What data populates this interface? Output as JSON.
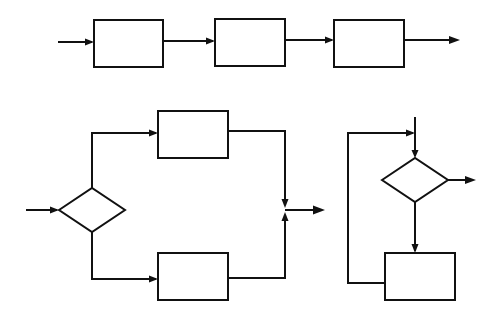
{
  "diagram": {
    "title": "",
    "groups": [
      {
        "id": "serial-chain",
        "description": "Three process blocks connected in series",
        "nodes": [
          {
            "id": "s1",
            "shape": "rect",
            "label": ""
          },
          {
            "id": "s2",
            "shape": "rect",
            "label": ""
          },
          {
            "id": "s3",
            "shape": "rect",
            "label": ""
          }
        ],
        "edges": [
          {
            "from": "input",
            "to": "s1"
          },
          {
            "from": "s1",
            "to": "s2"
          },
          {
            "from": "s2",
            "to": "s3"
          },
          {
            "from": "s3",
            "to": "output"
          }
        ]
      },
      {
        "id": "branch",
        "description": "Decision splits into two parallel process blocks that merge into one output",
        "nodes": [
          {
            "id": "d1",
            "shape": "diamond",
            "label": ""
          },
          {
            "id": "b1",
            "shape": "rect",
            "label": ""
          },
          {
            "id": "b2",
            "shape": "rect",
            "label": ""
          },
          {
            "id": "j1",
            "shape": "junction",
            "label": ""
          }
        ],
        "edges": [
          {
            "from": "input",
            "to": "d1"
          },
          {
            "from": "d1",
            "to": "b1"
          },
          {
            "from": "d1",
            "to": "b2"
          },
          {
            "from": "b1",
            "to": "j1"
          },
          {
            "from": "b2",
            "to": "j1"
          },
          {
            "from": "j1",
            "to": "output"
          }
        ]
      },
      {
        "id": "loop",
        "description": "Decision with exit; otherwise process block and loop back to decision",
        "nodes": [
          {
            "id": "d2",
            "shape": "diamond",
            "label": ""
          },
          {
            "id": "l1",
            "shape": "rect",
            "label": ""
          }
        ],
        "edges": [
          {
            "from": "input",
            "to": "d2"
          },
          {
            "from": "d2",
            "to": "output"
          },
          {
            "from": "d2",
            "to": "l1"
          },
          {
            "from": "l1",
            "to": "d2",
            "kind": "feedback"
          }
        ]
      }
    ]
  }
}
